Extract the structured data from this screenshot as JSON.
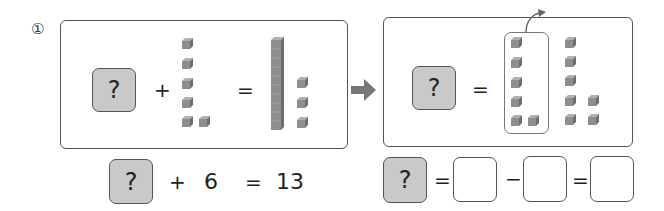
{
  "problem": {
    "number_label": "①"
  },
  "left_panel": {
    "unknown_label": "?",
    "plus": "+",
    "equals": "=",
    "addend_cubes": 6,
    "result_tens_rods": 1,
    "result_ones_cubes": 3
  },
  "transition_arrow": "right-arrow",
  "right_panel": {
    "unknown_label": "?",
    "equals": "=",
    "grouped_cubes": 6,
    "remaining_cubes": 7
  },
  "equation_addition": {
    "unknown_label": "?",
    "plus": "+",
    "addend": "6",
    "equals": "=",
    "sum": "13"
  },
  "equation_subtraction": {
    "unknown_label": "?",
    "equals_1": "=",
    "blank_1": "",
    "minus": "−",
    "blank_2": "",
    "equals_2": "=",
    "blank_3": ""
  },
  "colors": {
    "unknown_fill": "#c9c9c9",
    "border": "#555555",
    "cube": "#8a8a8a",
    "arrow": "#777777"
  }
}
